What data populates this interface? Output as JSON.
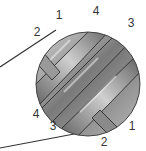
{
  "diagram": {
    "strand_labels_top": [
      {
        "text": "2",
        "x": 37,
        "y": 32
      },
      {
        "text": "1",
        "x": 59,
        "y": 15
      },
      {
        "text": "4",
        "x": 96,
        "y": 11
      },
      {
        "text": "3",
        "x": 131,
        "y": 23
      }
    ],
    "strand_labels_bottom": [
      {
        "text": "4",
        "x": 36,
        "y": 114
      },
      {
        "text": "3",
        "x": 53,
        "y": 126
      },
      {
        "text": "2",
        "x": 104,
        "y": 142
      },
      {
        "text": "1",
        "x": 132,
        "y": 126
      }
    ],
    "colors": {
      "stroke": "#333333",
      "fill_dark": "#6b6b6b",
      "fill_light": "#c9c9c9"
    }
  }
}
